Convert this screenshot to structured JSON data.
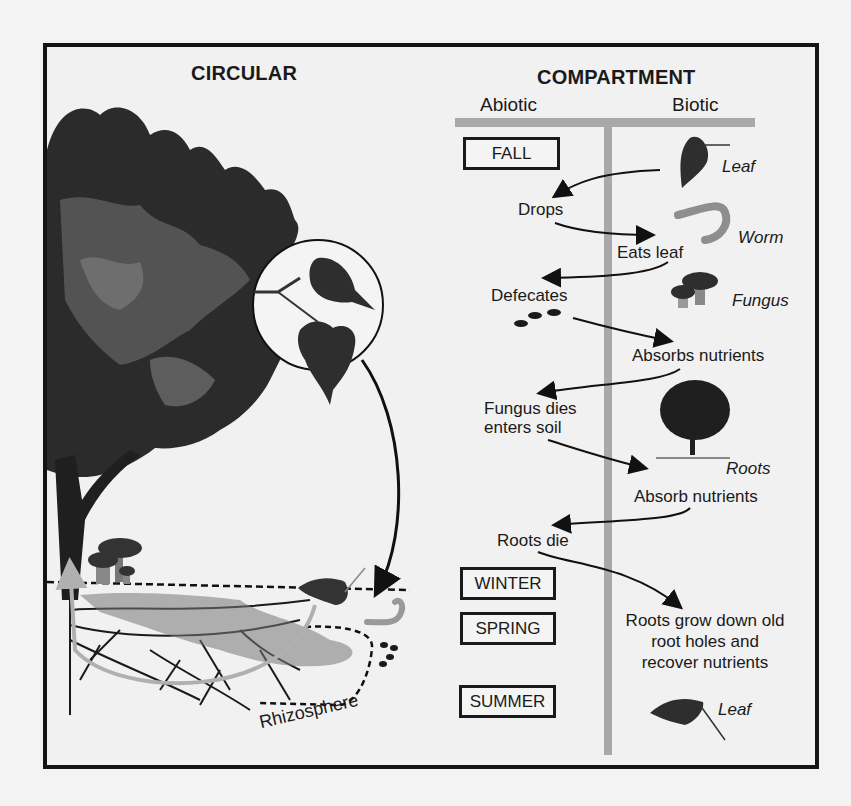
{
  "figure": {
    "left_title": "CIRCULAR",
    "right_title": "COMPARTMENT",
    "columns": {
      "abiotic": "Abiotic",
      "biotic": "Biotic"
    },
    "seasons": [
      "FALL",
      "WINTER",
      "SPRING",
      "SUMMER"
    ],
    "organisms": {
      "leaf_top": "Leaf",
      "worm": "Worm",
      "fungus": "Fungus",
      "roots": "Roots",
      "leaf_bottom": "Leaf"
    },
    "steps": [
      "Drops",
      "Eats leaf",
      "Defecates",
      "Absorbs nutrients",
      "Fungus dies",
      "enters soil",
      "Absorb nutrients",
      "Roots die",
      "Roots grow down old",
      "root holes and",
      "recover nutrients"
    ],
    "rhizosphere_label": "Rhizosphere"
  },
  "colors": {
    "frame": "#141414",
    "t_bar": "#a9a9a9",
    "foliage_dark": "#2b2b2b",
    "foliage_mid": "#5a5a5a",
    "arrow_light": "#b8b8b8",
    "worm": "#8e8e8e"
  }
}
